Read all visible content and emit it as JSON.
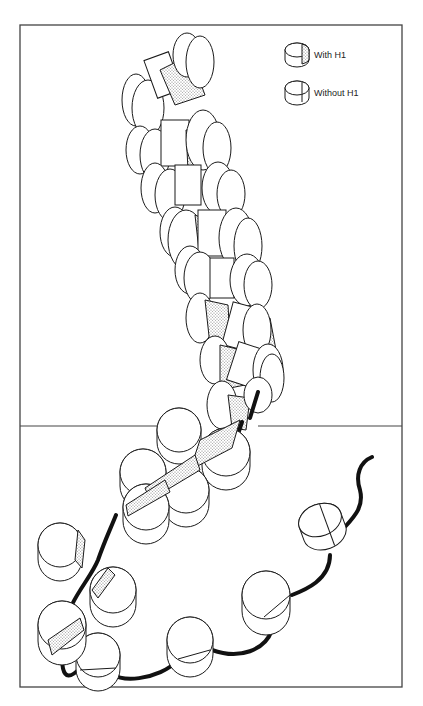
{
  "figure": {
    "colors": {
      "stroke": "#1a1a1a",
      "shade": "#c8c8c8",
      "dna": "#111111",
      "frame": "#444444",
      "background": "#ffffff"
    }
  },
  "legend": {
    "items": [
      {
        "label": "With H1",
        "shaded": true
      },
      {
        "label": "Without H1",
        "shaded": false
      }
    ]
  },
  "panels": [
    {
      "name": "condensed-fiber",
      "region": "upper"
    },
    {
      "name": "extended-fiber",
      "region": "lower"
    }
  ]
}
